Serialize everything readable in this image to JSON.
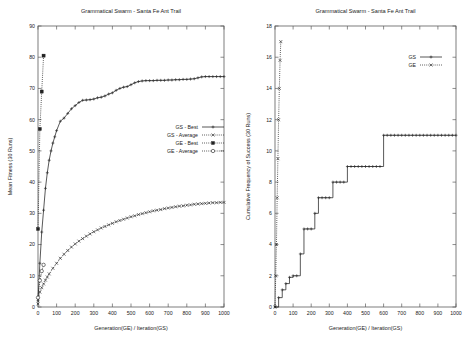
{
  "figure": {
    "background": "#ffffff",
    "ink_color": "#222222",
    "frame_color": "#5d5d5d"
  },
  "chart_data": [
    {
      "type": "line",
      "panel": "left",
      "title": "Grammatical Swarm - Santa Fe Ant Trail",
      "xlabel": "Generation(GE) / Iteration(GS)",
      "ylabel": "Mean Fitness (30 Runs)",
      "xlim": [
        0,
        1000
      ],
      "ylim": [
        0,
        90
      ],
      "xticks": [
        0,
        100,
        200,
        300,
        400,
        500,
        600,
        700,
        800,
        900,
        1000
      ],
      "yticks": [
        0,
        10,
        20,
        30,
        40,
        50,
        60,
        70,
        80,
        90
      ],
      "grid": false,
      "legend_position": "center-right",
      "series": [
        {
          "name": "GS - Best",
          "style": "solid-line-plus",
          "marker": "plus",
          "x": [
            0,
            10,
            20,
            30,
            40,
            50,
            60,
            70,
            80,
            90,
            100,
            120,
            140,
            160,
            180,
            200,
            220,
            240,
            260,
            280,
            300,
            320,
            340,
            360,
            380,
            400,
            420,
            440,
            460,
            480,
            500,
            520,
            540,
            560,
            580,
            600,
            620,
            640,
            660,
            680,
            700,
            720,
            740,
            760,
            780,
            800,
            820,
            840,
            860,
            880,
            900,
            920,
            940,
            960,
            980,
            1000
          ],
          "y": [
            2,
            14,
            24,
            31,
            38,
            43,
            47,
            50,
            52.5,
            54.5,
            56.5,
            59.5,
            60.5,
            62,
            63.5,
            64.5,
            65.5,
            66.2,
            66.3,
            66.4,
            66.6,
            67,
            67.2,
            67.6,
            68.2,
            68.6,
            69.4,
            70,
            70.4,
            70.6,
            71.2,
            71.8,
            72.2,
            72.4,
            72.5,
            72.5,
            72.5,
            72.6,
            72.6,
            72.6,
            72.7,
            72.7,
            72.8,
            72.8,
            72.9,
            72.9,
            73,
            73.1,
            73.4,
            73.7,
            73.8,
            73.8,
            73.8,
            73.8,
            73.8,
            73.8
          ]
        },
        {
          "name": "GS - Average",
          "style": "dotted-line-cross",
          "marker": "cross",
          "x": [
            0,
            10,
            20,
            30,
            40,
            50,
            60,
            80,
            100,
            120,
            140,
            160,
            180,
            200,
            220,
            240,
            260,
            280,
            300,
            320,
            340,
            360,
            380,
            400,
            420,
            440,
            460,
            480,
            500,
            520,
            540,
            560,
            580,
            600,
            620,
            640,
            660,
            680,
            700,
            720,
            740,
            760,
            780,
            800,
            820,
            840,
            860,
            880,
            900,
            920,
            940,
            960,
            980,
            1000
          ],
          "y": [
            1,
            4.8,
            6.2,
            7.4,
            8.6,
            9.6,
            10.6,
            12.4,
            14,
            15.6,
            16.9,
            18.1,
            19.2,
            20.2,
            21.1,
            21.9,
            22.7,
            23.4,
            24.1,
            24.7,
            25.3,
            25.8,
            26.3,
            26.8,
            27.3,
            27.7,
            28.1,
            28.5,
            28.9,
            29.2,
            29.6,
            29.9,
            30.2,
            30.5,
            30.8,
            31,
            31.2,
            31.5,
            31.7,
            31.9,
            32.1,
            32.3,
            32.4,
            32.6,
            32.7,
            32.9,
            33,
            33.1,
            33.2,
            33.3,
            33.4,
            33.4,
            33.5,
            33.5
          ]
        },
        {
          "name": "GE - Best",
          "style": "dotted-line-square",
          "marker": "filled-square",
          "x": [
            0,
            10,
            20,
            30
          ],
          "y": [
            25,
            57,
            69,
            80.5
          ]
        },
        {
          "name": "GE - Average",
          "style": "dotted-line-circle",
          "marker": "open-circle",
          "x": [
            0,
            10,
            20,
            30
          ],
          "y": [
            3,
            8.5,
            11.5,
            13.5
          ]
        }
      ]
    },
    {
      "type": "line",
      "panel": "right",
      "title": "Grammatical Swarm - Santa Fe Ant Trail",
      "xlabel": "Generation(GE) / Iteration(GS)",
      "ylabel": "Cumulative Frequency of Success (30 Runs)",
      "xlim": [
        0,
        1000
      ],
      "ylim": [
        0,
        18
      ],
      "xticks": [
        0,
        100,
        200,
        300,
        400,
        500,
        600,
        700,
        800,
        900,
        1000
      ],
      "yticks": [
        0,
        2,
        4,
        6,
        8,
        10,
        12,
        14,
        16,
        18
      ],
      "grid": false,
      "legend_position": "top-right",
      "series": [
        {
          "name": "GS",
          "style": "solid-step-plus",
          "marker": "plus",
          "x": [
            0,
            20,
            40,
            60,
            80,
            100,
            120,
            140,
            160,
            180,
            200,
            220,
            240,
            260,
            280,
            300,
            320,
            340,
            360,
            380,
            400,
            420,
            440,
            460,
            480,
            500,
            520,
            540,
            560,
            580,
            600,
            620,
            640,
            660,
            680,
            700,
            720,
            740,
            760,
            780,
            800,
            820,
            840,
            860,
            880,
            900,
            920,
            940,
            960,
            980,
            1000
          ],
          "y": [
            0,
            0.6,
            1.1,
            1.5,
            1.9,
            2,
            2,
            3.4,
            5,
            5,
            5,
            6,
            7,
            7,
            7,
            7,
            8,
            8,
            8,
            8,
            9,
            9,
            9,
            9,
            9,
            9,
            9,
            9,
            9,
            9,
            11,
            11,
            11,
            11,
            11,
            11,
            11,
            11,
            11,
            11,
            11,
            11,
            11,
            11,
            11,
            11,
            11,
            11,
            11,
            11,
            11
          ]
        },
        {
          "name": "GE",
          "style": "dotted-line-cross",
          "marker": "cross",
          "x": [
            0,
            4,
            8,
            12,
            16,
            20,
            24,
            28,
            32
          ],
          "y": [
            0,
            2,
            4,
            7,
            9.5,
            12,
            14,
            15.8,
            17
          ]
        }
      ]
    }
  ],
  "legends": {
    "left": [
      "GS - Best",
      "GS - Average",
      "GE - Best",
      "GE - Average"
    ],
    "right": [
      "GS",
      "GE"
    ]
  }
}
